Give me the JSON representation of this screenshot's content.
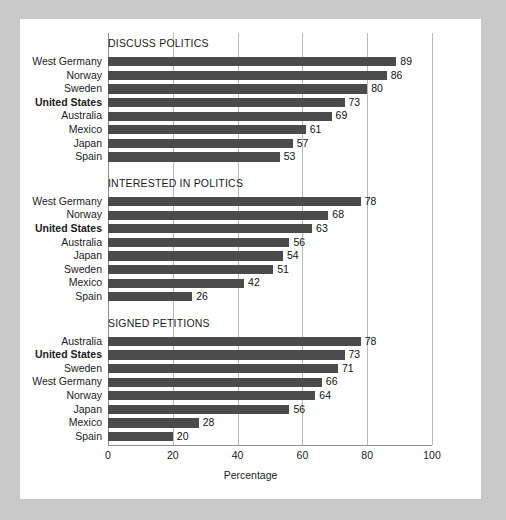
{
  "chart_data": {
    "type": "bar",
    "orientation": "horizontal",
    "title": "",
    "xlabel": "Percentage",
    "ylabel": "",
    "xlim": [
      0,
      100
    ],
    "xticks": [
      0,
      20,
      40,
      60,
      80,
      100
    ],
    "xtick_labels": [
      "0",
      "20",
      "40",
      "60",
      "80",
      "100"
    ],
    "grid": true,
    "grid_axis": "x",
    "legend": false,
    "bar_color": "#4b4b4b",
    "highlight_category": "United States",
    "panels": [
      {
        "title": "DISCUSS POLITICS",
        "categories": [
          "West Germany",
          "Norway",
          "Sweden",
          "United States",
          "Australia",
          "Mexico",
          "Japan",
          "Spain"
        ],
        "values": [
          89,
          86,
          80,
          73,
          69,
          61,
          57,
          53
        ]
      },
      {
        "title": "INTERESTED IN POLITICS",
        "categories": [
          "West Germany",
          "Norway",
          "United States",
          "Australia",
          "Japan",
          "Sweden",
          "Mexico",
          "Spain"
        ],
        "values": [
          78,
          68,
          63,
          56,
          54,
          51,
          42,
          26
        ]
      },
      {
        "title": "SIGNED PETITIONS",
        "categories": [
          "Australia",
          "United States",
          "Sweden",
          "West Germany",
          "Norway",
          "Japan",
          "Mexico",
          "Spain"
        ],
        "values": [
          78,
          73,
          71,
          66,
          64,
          56,
          28,
          20
        ]
      }
    ]
  }
}
